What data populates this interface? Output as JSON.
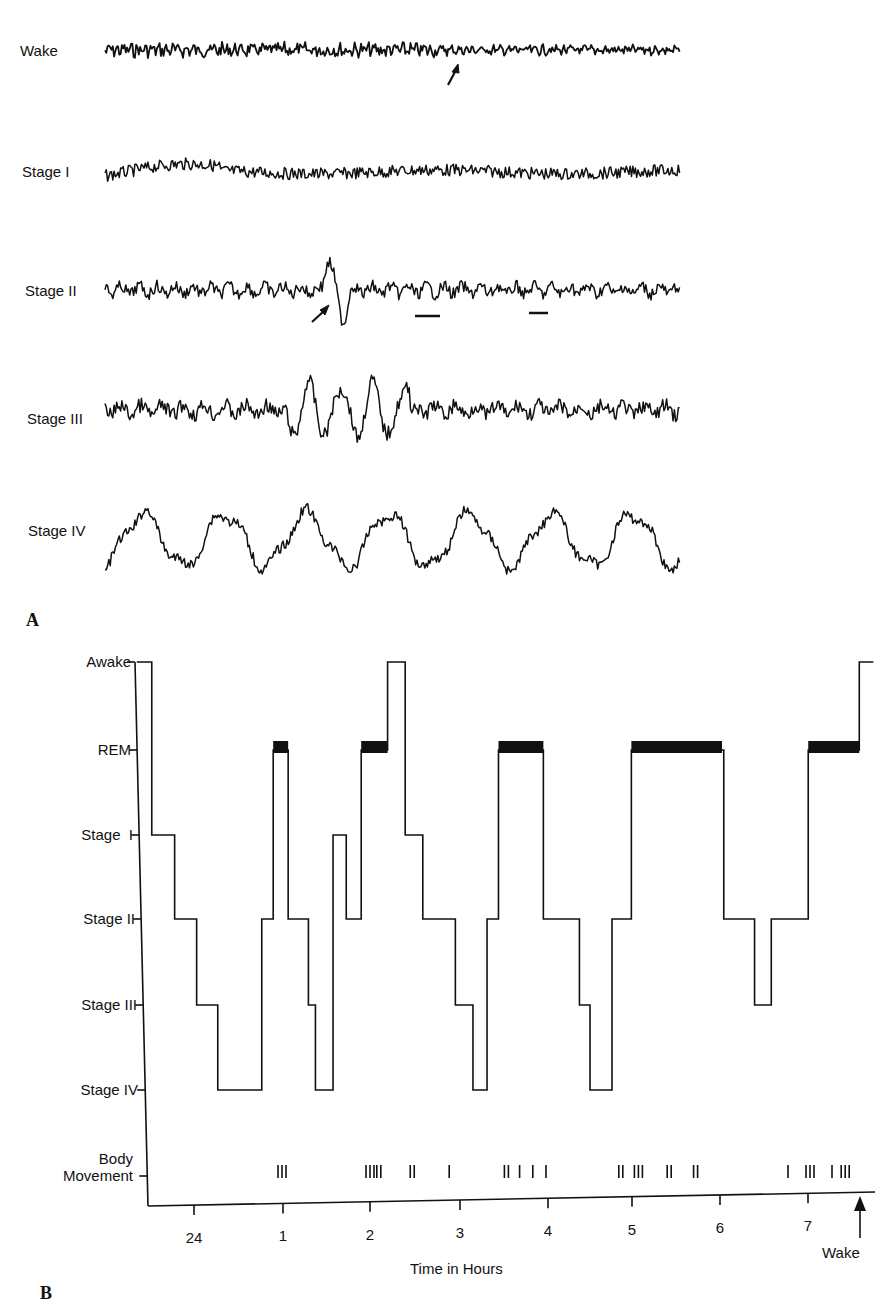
{
  "panel_a": {
    "letter": "A",
    "traces": [
      {
        "label": "Wake",
        "y": 50,
        "amplitude": 8,
        "freq": 2.6,
        "style": "dense-then-sparse",
        "annotation": "arrow marks transition to alpha"
      },
      {
        "label": "Stage I",
        "y": 172,
        "amplitude": 12,
        "freq": 1.6,
        "style": "low-mixed"
      },
      {
        "label": "Stage II",
        "y": 290,
        "amplitude": 12,
        "freq": 1.5,
        "style": "spindles-k-complex",
        "annotation": "arrow marks K-complex; bars mark sleep spindles"
      },
      {
        "label": "Stage III",
        "y": 410,
        "amplitude": 16,
        "freq": 1.4,
        "style": "delta-burst"
      },
      {
        "label": "Stage IV",
        "y": 540,
        "amplitude": 26,
        "freq": 0.9,
        "style": "delta-high"
      }
    ]
  },
  "panel_b": {
    "letter": "B",
    "y_levels": [
      {
        "label": "Awake",
        "y": 662
      },
      {
        "label": "REM",
        "y": 750
      },
      {
        "label": "Stage  I",
        "y": 835
      },
      {
        "label": "Stage II",
        "y": 919
      },
      {
        "label": "Stage III",
        "y": 1005
      },
      {
        "label": "Stage IV",
        "y": 1090
      },
      {
        "label": "Body\nMovement",
        "y": 1176
      }
    ],
    "body_movement_label_line1": "Body",
    "body_movement_label_line2": "Movement",
    "x_ticks": [
      {
        "label": "24",
        "x": 194
      },
      {
        "label": "1",
        "x": 283
      },
      {
        "label": "2",
        "x": 370
      },
      {
        "label": "3",
        "x": 460
      },
      {
        "label": "4",
        "x": 548
      },
      {
        "label": "5",
        "x": 632
      },
      {
        "label": "6",
        "x": 720
      },
      {
        "label": "7",
        "x": 808
      }
    ],
    "x_axis_title": "Time in Hours",
    "wake_marker_label": "Wake",
    "body_movement_marks": [
      "III",
      "III",
      "II",
      "II",
      "I",
      "II",
      "I",
      "I",
      "I",
      "II",
      "III",
      "II",
      "II",
      "I",
      "III",
      "I",
      "III"
    ]
  },
  "chart_data": {
    "type": "line",
    "xlabel": "Time in Hours",
    "ylabel": "Sleep stage",
    "x_tick_labels": [
      "24",
      "1",
      "2",
      "3",
      "4",
      "5",
      "6",
      "7"
    ],
    "y_categories": [
      "Awake",
      "REM",
      "Stage I",
      "Stage II",
      "Stage III",
      "Stage IV"
    ],
    "series": [
      {
        "name": "Sleep stage (hours after midnight; 24 = midnight)",
        "points": [
          {
            "t": -0.65,
            "stage": "Awake"
          },
          {
            "t": -0.48,
            "stage": "Stage I"
          },
          {
            "t": -0.22,
            "stage": "Stage II"
          },
          {
            "t": 0.03,
            "stage": "Stage III"
          },
          {
            "t": 0.27,
            "stage": "Stage IV"
          },
          {
            "t": 0.77,
            "stage": "Stage II"
          },
          {
            "t": 0.9,
            "stage": "REM"
          },
          {
            "t": 1.07,
            "stage": "Stage II"
          },
          {
            "t": 1.3,
            "stage": "Stage III"
          },
          {
            "t": 1.38,
            "stage": "Stage IV"
          },
          {
            "t": 1.58,
            "stage": "Stage I"
          },
          {
            "t": 1.73,
            "stage": "Stage II"
          },
          {
            "t": 1.9,
            "stage": "REM"
          },
          {
            "t": 2.2,
            "stage": "Awake"
          },
          {
            "t": 2.4,
            "stage": "Stage I"
          },
          {
            "t": 2.6,
            "stage": "Stage II"
          },
          {
            "t": 2.97,
            "stage": "Stage III"
          },
          {
            "t": 3.17,
            "stage": "Stage IV"
          },
          {
            "t": 3.33,
            "stage": "Stage II"
          },
          {
            "t": 3.46,
            "stage": "REM"
          },
          {
            "t": 3.97,
            "stage": "Stage II"
          },
          {
            "t": 4.38,
            "stage": "Stage III"
          },
          {
            "t": 4.5,
            "stage": "Stage IV"
          },
          {
            "t": 4.75,
            "stage": "Stage II"
          },
          {
            "t": 4.97,
            "stage": "REM"
          },
          {
            "t": 6.02,
            "stage": "Stage II"
          },
          {
            "t": 6.37,
            "stage": "Stage III"
          },
          {
            "t": 6.56,
            "stage": "Stage II"
          },
          {
            "t": 6.98,
            "stage": "REM"
          },
          {
            "t": 7.56,
            "stage": "Awake"
          }
        ]
      }
    ],
    "rem_periods_hours": [
      [
        0.9,
        1.07
      ],
      [
        1.9,
        2.2
      ],
      [
        3.46,
        3.97
      ],
      [
        4.97,
        6.0
      ],
      [
        6.98,
        7.56
      ]
    ],
    "body_movement_hours": [
      1.0,
      2.0,
      2.1,
      2.48,
      2.9,
      3.55,
      3.7,
      3.85,
      4.0,
      4.85,
      5.05,
      5.4,
      5.7,
      6.75,
      7.0,
      7.25,
      7.4
    ],
    "annotations": [
      "Wake (arrow at end of night)"
    ],
    "grid": false
  }
}
